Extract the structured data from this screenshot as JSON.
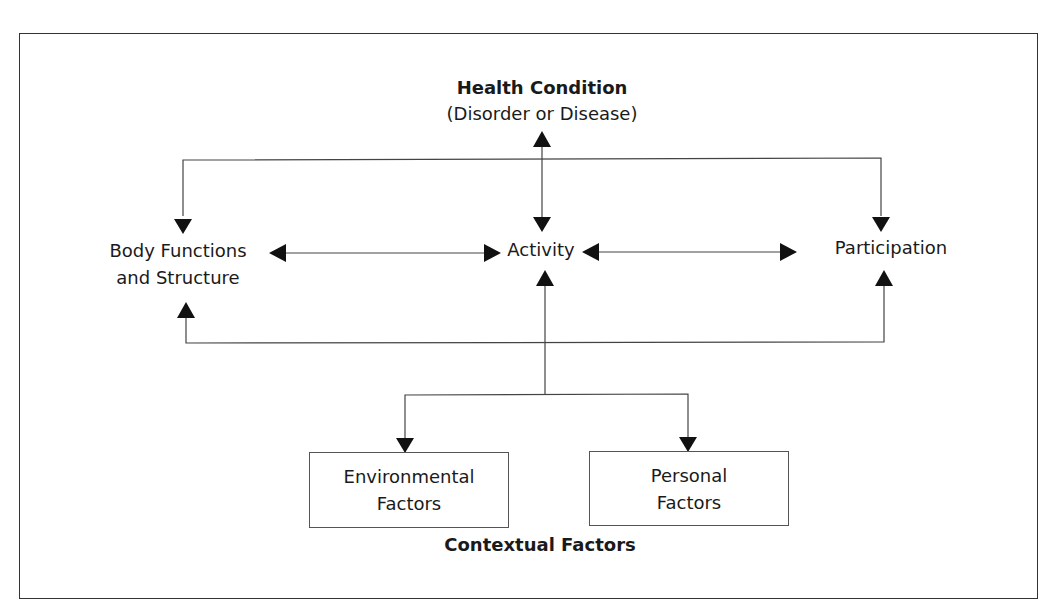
{
  "diagram": {
    "health_condition": {
      "title": "Health Condition",
      "subtitle": "(Disorder or Disease)"
    },
    "body_functions": {
      "line1": "Body Functions",
      "line2": "and Structure"
    },
    "activity": {
      "label": "Activity"
    },
    "participation": {
      "label": "Participation"
    },
    "environmental_factors": {
      "line1": "Environmental",
      "line2": "Factors"
    },
    "personal_factors": {
      "line1": "Personal",
      "line2": "Factors"
    },
    "contextual_factors": {
      "label": "Contextual Factors"
    },
    "colors": {
      "line": "#333333",
      "text": "#1a1a1a",
      "background": "#ffffff"
    }
  }
}
